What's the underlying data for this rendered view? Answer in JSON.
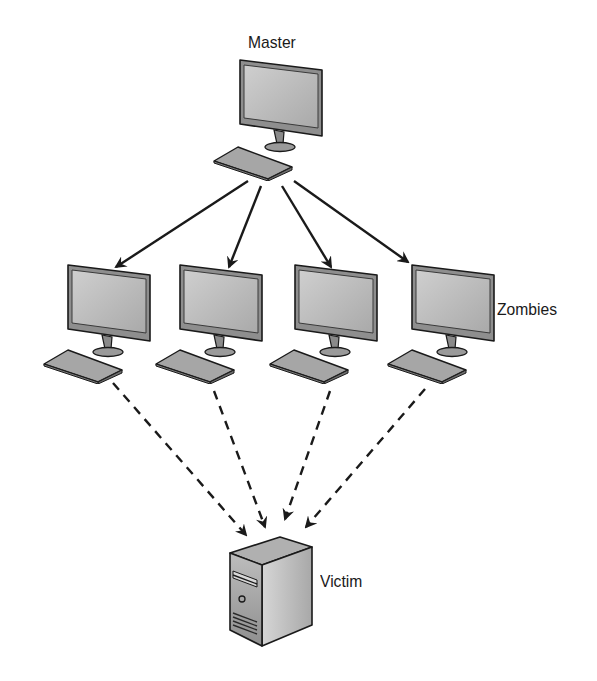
{
  "diagram": {
    "type": "ddos-botnet-topology",
    "nodes": {
      "master": {
        "label": "Master",
        "icon": "desktop-computer-icon"
      },
      "zombies": {
        "label": "Zombies",
        "count": 4,
        "icon": "desktop-computer-icon"
      },
      "victim": {
        "label": "Victim",
        "icon": "server-tower-icon"
      }
    },
    "edges": [
      {
        "from": "master",
        "to": "zombie-1",
        "style": "solid-arrow"
      },
      {
        "from": "master",
        "to": "zombie-2",
        "style": "solid-arrow"
      },
      {
        "from": "master",
        "to": "zombie-3",
        "style": "solid-arrow"
      },
      {
        "from": "master",
        "to": "zombie-4",
        "style": "solid-arrow"
      },
      {
        "from": "zombie-1",
        "to": "victim",
        "style": "dashed-arrow"
      },
      {
        "from": "zombie-2",
        "to": "victim",
        "style": "dashed-arrow"
      },
      {
        "from": "zombie-3",
        "to": "victim",
        "style": "dashed-arrow"
      },
      {
        "from": "zombie-4",
        "to": "victim",
        "style": "dashed-arrow"
      }
    ],
    "colors": {
      "stroke": "#1a1a1a",
      "screen": "#b8b8b8",
      "body": "#9a9a9a",
      "keyboard": "#a6a6a6"
    }
  }
}
